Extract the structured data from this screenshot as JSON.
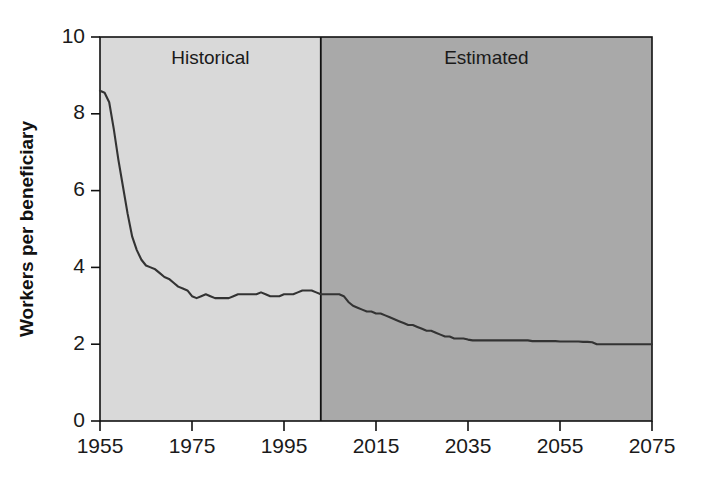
{
  "chart_data": {
    "type": "line",
    "title": "",
    "subtitle": "",
    "xlabel": "",
    "ylabel": "Workers per beneficiary",
    "xlim": [
      1955,
      2075
    ],
    "ylim": [
      0,
      10
    ],
    "grid": false,
    "legend_position": "none",
    "xticks": [
      1955,
      1975,
      1995,
      2015,
      2035,
      2055,
      2075
    ],
    "xtick_labels": [
      "1955",
      "1975",
      "1995",
      "2015",
      "2035",
      "2055",
      "2075"
    ],
    "yticks": [
      0,
      2,
      4,
      6,
      8,
      10
    ],
    "ytick_labels": [
      "0",
      "2",
      "4",
      "6",
      "8",
      "10"
    ],
    "annotations": [
      {
        "text": "Historical",
        "x": 1979,
        "y": 9.3,
        "region": "historical"
      },
      {
        "text": "Estimated",
        "x": 2039,
        "y": 9.3,
        "region": "estimated"
      }
    ],
    "regions": [
      {
        "name": "Historical",
        "x_start": 1955,
        "x_end": 2003,
        "color": "#d9d9d9"
      },
      {
        "name": "Estimated",
        "x_start": 2003,
        "x_end": 2075,
        "color": "#a9a9a9"
      }
    ],
    "divider_year": 2003,
    "series": [
      {
        "name": "Workers per beneficiary",
        "color": "#333333",
        "x": [
          1955,
          1956,
          1957,
          1958,
          1959,
          1960,
          1961,
          1962,
          1963,
          1964,
          1965,
          1966,
          1967,
          1968,
          1969,
          1970,
          1971,
          1972,
          1973,
          1974,
          1975,
          1976,
          1977,
          1978,
          1979,
          1980,
          1981,
          1982,
          1983,
          1984,
          1985,
          1986,
          1987,
          1988,
          1989,
          1990,
          1991,
          1992,
          1993,
          1994,
          1995,
          1996,
          1997,
          1998,
          1999,
          2000,
          2001,
          2002,
          2003,
          2004,
          2005,
          2006,
          2007,
          2008,
          2009,
          2010,
          2011,
          2012,
          2013,
          2014,
          2015,
          2016,
          2017,
          2018,
          2019,
          2020,
          2021,
          2022,
          2023,
          2024,
          2025,
          2026,
          2027,
          2028,
          2029,
          2030,
          2031,
          2032,
          2033,
          2034,
          2035,
          2036,
          2037,
          2038,
          2039,
          2040,
          2041,
          2042,
          2043,
          2044,
          2045,
          2046,
          2047,
          2048,
          2049,
          2050,
          2051,
          2052,
          2053,
          2054,
          2055,
          2056,
          2057,
          2058,
          2059,
          2060,
          2061,
          2062,
          2063,
          2064,
          2065,
          2066,
          2067,
          2068,
          2069,
          2070,
          2071,
          2072,
          2073,
          2074,
          2075
        ],
        "values": [
          8.6,
          8.55,
          8.3,
          7.6,
          6.8,
          6.1,
          5.4,
          4.8,
          4.45,
          4.2,
          4.05,
          4.0,
          3.95,
          3.85,
          3.75,
          3.7,
          3.6,
          3.5,
          3.45,
          3.4,
          3.25,
          3.2,
          3.25,
          3.3,
          3.25,
          3.2,
          3.2,
          3.2,
          3.2,
          3.25,
          3.3,
          3.3,
          3.3,
          3.3,
          3.3,
          3.35,
          3.3,
          3.25,
          3.25,
          3.25,
          3.3,
          3.3,
          3.3,
          3.35,
          3.4,
          3.4,
          3.4,
          3.35,
          3.3,
          3.3,
          3.3,
          3.3,
          3.3,
          3.25,
          3.1,
          3.0,
          2.95,
          2.9,
          2.85,
          2.85,
          2.8,
          2.8,
          2.75,
          2.7,
          2.65,
          2.6,
          2.55,
          2.5,
          2.5,
          2.45,
          2.4,
          2.35,
          2.35,
          2.3,
          2.25,
          2.2,
          2.2,
          2.15,
          2.15,
          2.15,
          2.12,
          2.1,
          2.1,
          2.1,
          2.1,
          2.1,
          2.1,
          2.1,
          2.1,
          2.1,
          2.1,
          2.1,
          2.1,
          2.1,
          2.08,
          2.08,
          2.08,
          2.08,
          2.08,
          2.08,
          2.07,
          2.07,
          2.07,
          2.07,
          2.07,
          2.06,
          2.06,
          2.05,
          2.0,
          2.0,
          2.0,
          2.0,
          2.0,
          2.0,
          2.0,
          2.0,
          2.0,
          2.0,
          2.0,
          2.0,
          2.0
        ]
      }
    ]
  },
  "axes": {
    "ylabel": "Workers per beneficiary"
  },
  "colors": {
    "historical_fill": "#d9d9d9",
    "estimated_fill": "#a9a9a9",
    "line": "#333333",
    "axis": "#111111",
    "text": "#1a1a1a",
    "background": "#ffffff"
  }
}
